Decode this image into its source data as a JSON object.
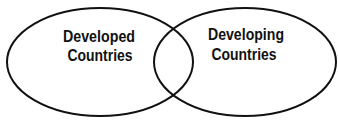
{
  "diagram": {
    "type": "venn",
    "colors": {
      "stroke": "#111111",
      "background": "#ffffff",
      "text": "#111111"
    },
    "sets": [
      {
        "id": "developed",
        "label_lines": [
          "Developed",
          "Countries"
        ]
      },
      {
        "id": "developing",
        "label_lines": [
          "Developing",
          "Countries"
        ]
      }
    ]
  }
}
